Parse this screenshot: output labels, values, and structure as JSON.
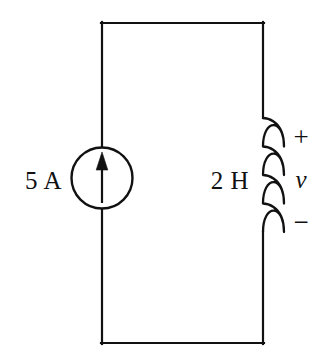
{
  "figure": {
    "type": "electrical-circuit-schematic",
    "title": "",
    "background_color": "#ffffff",
    "line_color": "#111111",
    "line_width": 2
  },
  "labels": {
    "current_source": "5 A",
    "inductor": "2 H",
    "polarity_plus": "+",
    "voltage": "v",
    "polarity_minus": "−"
  },
  "components": [
    {
      "name": "current-source",
      "symbol": "circle-with-up-arrow",
      "value": "5 A",
      "quantity": "current",
      "magnitude": 5,
      "unit": "A",
      "arrow_direction": "up",
      "position": {
        "cx": 102,
        "cy": 178,
        "r": 31
      }
    },
    {
      "name": "inductor",
      "symbol": "four-loop-coil",
      "value": "2 H",
      "quantity": "inductance",
      "magnitude": 2,
      "unit": "H",
      "loops": 4,
      "position": {
        "x": 263,
        "y_top": 118,
        "y_bottom": 232,
        "bulge": 20
      }
    }
  ],
  "wires": {
    "loop": "rectangle",
    "left_x": 102,
    "right_x": 263,
    "top_y": 22,
    "bottom_y": 344
  },
  "annotations": {
    "voltage_polarity": {
      "plus_at": "top-of-inductor",
      "minus_at": "bottom-of-inductor",
      "variable": "v"
    }
  }
}
